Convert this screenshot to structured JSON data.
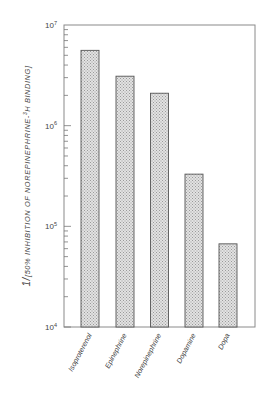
{
  "chart_data": {
    "type": "bar",
    "title": "",
    "xlabel": "",
    "ylabel": "1/[50% INHIBITION OF NOREPINEPHRINE-3H BINDING]",
    "ylabel_parts": {
      "prefix": "1/",
      "main": "[50% INHIBITION OF NOREPINEPHRINE-",
      "superscript": "3",
      "suffix": "H BINDING]"
    },
    "yscale": "log",
    "ylim": [
      10000,
      10000000
    ],
    "yticks": [
      {
        "value": 10000,
        "base": "10",
        "exp": "4"
      },
      {
        "value": 100000,
        "base": "10",
        "exp": "5"
      },
      {
        "value": 1000000,
        "base": "10",
        "exp": "6"
      },
      {
        "value": 10000000,
        "base": "10",
        "exp": "7"
      }
    ],
    "categories": [
      "Isoproterenol",
      "Epinephrine",
      "Norepinephrine",
      "Dopamine",
      "Dopa"
    ],
    "values": [
      5600000,
      3100000,
      2100000,
      330000,
      67000
    ],
    "bar_fill": "#d6d6d6",
    "bar_edge": "#555555",
    "grid": false,
    "legend": null
  }
}
